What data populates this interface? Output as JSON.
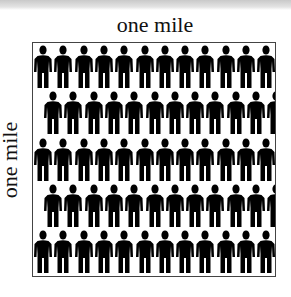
{
  "diagram": {
    "title_top": "one mile",
    "title_left": "one mile",
    "figure_icon": "person-icon",
    "figure_color": "#000000",
    "border_color": "#444444",
    "rows": [
      {
        "count": 12,
        "offset": 0
      },
      {
        "count": 12,
        "offset": 10
      },
      {
        "count": 12,
        "offset": 0
      },
      {
        "count": 12,
        "offset": 10
      },
      {
        "count": 12,
        "offset": 0
      }
    ]
  }
}
